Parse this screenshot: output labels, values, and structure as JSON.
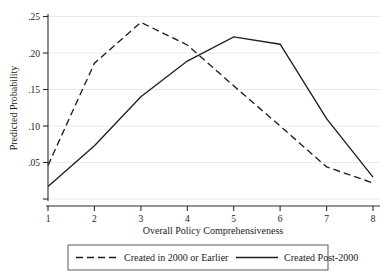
{
  "chart_data": {
    "type": "line",
    "title": "",
    "xlabel": "Overall Policy Comprehensiveness",
    "ylabel": "Predicted Probability",
    "x": [
      1,
      2,
      3,
      4,
      5,
      6,
      7,
      8
    ],
    "xtick_labels": [
      "1",
      "2",
      "3",
      "4",
      "5",
      "6",
      "7",
      "8"
    ],
    "ytick_labels": [
      ".05",
      ".10",
      ".15",
      ".20",
      ".25"
    ],
    "ytick_values": [
      0.05,
      0.1,
      0.15,
      0.2,
      0.25
    ],
    "xlim": [
      1,
      8
    ],
    "ylim": [
      0,
      0.262
    ],
    "grid": "horizontal",
    "legend_position": "below-axis",
    "series": [
      {
        "name": "Created in 2000 or Earlier",
        "style": "dashed",
        "color": "#1f1f1f",
        "values": [
          0.046,
          0.186,
          0.242,
          0.211,
          0.155,
          0.1,
          0.044,
          0.022
        ]
      },
      {
        "name": "Created Post-2000",
        "style": "solid",
        "color": "#1f1f1f",
        "values": [
          0.017,
          0.073,
          0.14,
          0.189,
          0.222,
          0.212,
          0.11,
          0.03
        ]
      }
    ]
  },
  "legend": {
    "entries": [
      {
        "label": "Created in 2000 or Earlier",
        "style": "dashed"
      },
      {
        "label": "Created Post-2000",
        "style": "solid"
      }
    ]
  },
  "axes": {
    "y_title": "Predicted Probability",
    "x_title": "Overall Policy Comprehensiveness"
  }
}
